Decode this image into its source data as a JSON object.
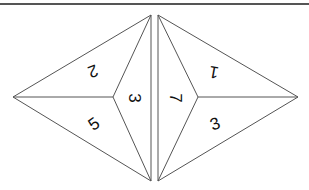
{
  "diagram": {
    "line_color": "#555555",
    "left_face": {
      "vertices": {
        "tip": [
          13,
          97
        ],
        "top": [
          151,
          15
        ],
        "bottom": [
          151,
          181
        ],
        "center": [
          113,
          97
        ]
      },
      "labels": [
        {
          "text": "2",
          "x": 93,
          "y": 71,
          "rotate": 160
        },
        {
          "text": "5",
          "x": 94,
          "y": 124,
          "rotate": -35
        },
        {
          "text": "3",
          "x": 134,
          "y": 98,
          "rotate": 90
        }
      ]
    },
    "right_face": {
      "vertices": {
        "top": [
          158,
          15
        ],
        "bottom": [
          158,
          181
        ],
        "center": [
          198,
          97
        ],
        "tip": [
          298,
          97
        ]
      },
      "labels": [
        {
          "text": "7",
          "x": 175,
          "y": 98,
          "rotate": 90
        },
        {
          "text": "1",
          "x": 214,
          "y": 72,
          "rotate": 190
        },
        {
          "text": "3",
          "x": 215,
          "y": 124,
          "rotate": -20
        }
      ]
    }
  }
}
